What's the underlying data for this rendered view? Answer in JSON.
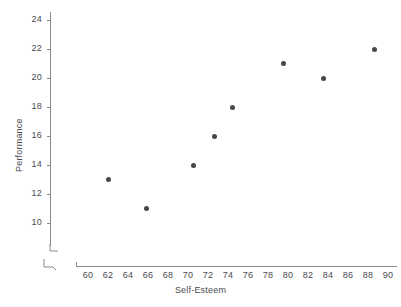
{
  "chart_data": {
    "type": "scatter",
    "title": "",
    "xlabel": "Self-Esteem",
    "ylabel": "Performance",
    "xlim": [
      59,
      91
    ],
    "ylim": [
      9,
      25
    ],
    "xticks": [
      60,
      62,
      64,
      66,
      68,
      70,
      72,
      74,
      76,
      78,
      80,
      82,
      84,
      86,
      88,
      90
    ],
    "yticks": [
      10,
      12,
      14,
      16,
      18,
      20,
      22,
      24
    ],
    "grid": false,
    "legend": null,
    "axis_break_x": true,
    "axis_break_y": true,
    "point_color": "#46464c",
    "axis_color": "#8a8a8f",
    "points": [
      {
        "x": 62.0,
        "y": 13
      },
      {
        "x": 65.8,
        "y": 11
      },
      {
        "x": 70.5,
        "y": 14
      },
      {
        "x": 72.6,
        "y": 16
      },
      {
        "x": 74.4,
        "y": 18
      },
      {
        "x": 79.5,
        "y": 21
      },
      {
        "x": 83.5,
        "y": 20
      },
      {
        "x": 88.6,
        "y": 22
      }
    ]
  }
}
